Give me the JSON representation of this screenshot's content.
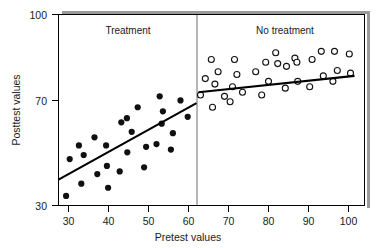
{
  "chart_data": {
    "type": "scatter",
    "title": "",
    "xlabel": "Pretest values",
    "ylabel": "Posttest values",
    "xlim": [
      27,
      103
    ],
    "ylim": [
      30,
      100
    ],
    "xticks": [
      30,
      40,
      50,
      60,
      70,
      80,
      90,
      100
    ],
    "yticks": [
      30,
      70,
      100
    ],
    "grid": false,
    "legend": "none",
    "annotations": [
      {
        "text": "Treatment",
        "x": 45,
        "y": 96
      },
      {
        "text": "No treatment",
        "x": 84,
        "y": 96
      }
    ],
    "divider_x": 62,
    "series": [
      {
        "name": "Treatment",
        "marker": "filled-circle",
        "color": "#101010",
        "points": [
          [
            29.4,
            33.5
          ],
          [
            30.3,
            47.0
          ],
          [
            32.6,
            52.0
          ],
          [
            33.2,
            38.0
          ],
          [
            33.8,
            48.5
          ],
          [
            36.5,
            55.0
          ],
          [
            37.2,
            41.5
          ],
          [
            39.4,
            52.0
          ],
          [
            39.6,
            44.5
          ],
          [
            39.9,
            36.5
          ],
          [
            42.8,
            42.5
          ],
          [
            43.2,
            60.5
          ],
          [
            44.6,
            62.0
          ],
          [
            44.7,
            49.5
          ],
          [
            45.8,
            57.0
          ],
          [
            47.3,
            66.0
          ],
          [
            48.9,
            44.0
          ],
          [
            49.4,
            51.5
          ],
          [
            52.0,
            52.5
          ],
          [
            52.8,
            70.0
          ],
          [
            53.3,
            60.0
          ],
          [
            53.6,
            64.5
          ],
          [
            55.6,
            50.5
          ],
          [
            56.1,
            56.5
          ],
          [
            58.0,
            68.5
          ],
          [
            59.8,
            62.5
          ]
        ],
        "fit_line": {
          "x0": 27.5,
          "y0": 39.5,
          "x1": 62.0,
          "y1": 67.5
        }
      },
      {
        "name": "No treatment",
        "marker": "open-circle",
        "color": "#ffffff",
        "points": [
          [
            63.0,
            70.5
          ],
          [
            64.2,
            76.5
          ],
          [
            65.7,
            83.5
          ],
          [
            66.0,
            66.0
          ],
          [
            66.6,
            74.5
          ],
          [
            67.4,
            79.0
          ],
          [
            69.0,
            70.0
          ],
          [
            70.4,
            68.0
          ],
          [
            71.0,
            73.5
          ],
          [
            71.5,
            83.5
          ],
          [
            72.1,
            78.0
          ],
          [
            73.5,
            71.5
          ],
          [
            76.8,
            79.0
          ],
          [
            78.3,
            70.5
          ],
          [
            79.3,
            82.5
          ],
          [
            80.0,
            75.5
          ],
          [
            81.8,
            86.0
          ],
          [
            82.3,
            82.0
          ],
          [
            84.2,
            73.0
          ],
          [
            84.5,
            81.0
          ],
          [
            86.6,
            84.0
          ],
          [
            87.1,
            82.5
          ],
          [
            87.3,
            75.5
          ],
          [
            90.3,
            73.5
          ],
          [
            90.9,
            83.5
          ],
          [
            93.2,
            86.5
          ],
          [
            93.7,
            77.5
          ],
          [
            96.1,
            75.5
          ],
          [
            96.5,
            86.5
          ],
          [
            97.2,
            79.5
          ],
          [
            100.2,
            85.5
          ],
          [
            100.5,
            78.5
          ]
        ],
        "fit_line": {
          "x0": 62.5,
          "y0": 71.5,
          "x1": 101.5,
          "y1": 77.5
        }
      }
    ]
  },
  "axes": {
    "y_label": "Posttest values",
    "x_label": "Pretest values",
    "y_tick_labels": [
      "100",
      "70",
      "30"
    ],
    "x_tick_labels": [
      "30",
      "40",
      "50",
      "60",
      "70",
      "80",
      "90",
      "100"
    ]
  },
  "labels": {
    "treatment": "Treatment",
    "no_treatment": "No treatment"
  },
  "colors": {
    "axis": "#000000",
    "filled_marker": "#101010",
    "open_marker_stroke": "#101010",
    "divider": "#b5b5b5",
    "shadow": "#9a9a9a",
    "background": "#ffffff"
  }
}
